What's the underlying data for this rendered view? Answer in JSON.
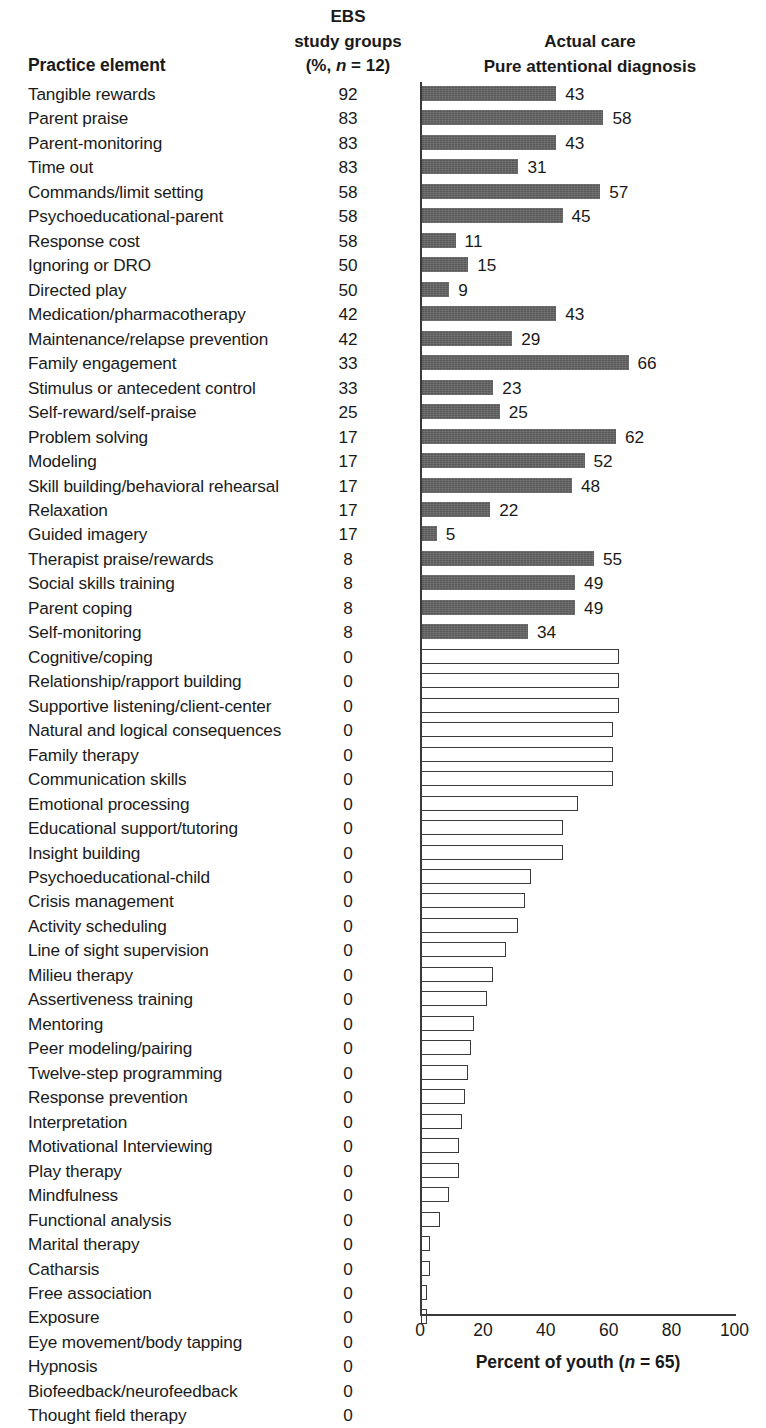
{
  "header": {
    "practice_element": "Practice element",
    "ebs_line1": "EBS",
    "ebs_line2": "study groups",
    "ebs_line3_pre": "(%, ",
    "ebs_line3_ital": "n",
    "ebs_line3_post": " = 12)",
    "actual_line1": "Actual care",
    "actual_line2": "Pure attentional diagnosis"
  },
  "axis": {
    "ticks": [
      "0",
      "20",
      "40",
      "60",
      "80",
      "100"
    ],
    "xlabel_pre": "Percent of youth (",
    "xlabel_ital": "n",
    "xlabel_post": " = 65)"
  },
  "chart_data": {
    "type": "bar",
    "xlabel": "Percent of youth (n = 65)",
    "ylabel": "Practice element",
    "xlim": [
      0,
      100
    ],
    "grid": false,
    "legend": null,
    "orientation": "horizontal",
    "columns": [
      "Practice element",
      "EBS study groups (%, n = 12)",
      "Actual care Pure attentional diagnosis"
    ],
    "series": [
      {
        "name": "EBS study groups (%, n = 12)",
        "kind": "text-column"
      },
      {
        "name": "Actual care — Pure attentional diagnosis",
        "kind": "bar"
      }
    ],
    "categories": [
      "Tangible rewards",
      "Parent praise",
      "Parent-monitoring",
      "Time out",
      "Commands/limit setting",
      "Psychoeducational-parent",
      "Response cost",
      "Ignoring or DRO",
      "Directed play",
      "Medication/pharmacotherapy",
      "Maintenance/relapse prevention",
      "Family engagement",
      "Stimulus or antecedent control",
      "Self-reward/self-praise",
      "Problem solving",
      "Modeling",
      "Skill building/behavioral rehearsal",
      "Relaxation",
      "Guided imagery",
      "Therapist praise/rewards",
      "Social skills training",
      "Parent coping",
      "Self-monitoring",
      "Cognitive/coping",
      "Relationship/rapport building",
      "Supportive listening/client-center",
      "Natural and logical consequences",
      "Family therapy",
      "Communication skills",
      "Emotional processing",
      "Educational support/tutoring",
      "Insight building",
      "Psychoeducational-child",
      "Crisis management",
      "Activity scheduling",
      "Line of sight supervision",
      "Milieu therapy",
      "Assertiveness training",
      "Mentoring",
      "Peer modeling/pairing",
      "Twelve-step programming",
      "Response prevention",
      "Interpretation",
      "Motivational Interviewing",
      "Play therapy",
      "Mindfulness",
      "Functional analysis",
      "Marital therapy",
      "Catharsis",
      "Free association",
      "Exposure",
      "Eye movement/body tapping",
      "Hypnosis",
      "Biofeedback/neurofeedback",
      "Thought field therapy"
    ],
    "ebs_percent": [
      92,
      83,
      83,
      83,
      58,
      58,
      58,
      50,
      50,
      42,
      42,
      33,
      33,
      25,
      17,
      17,
      17,
      17,
      17,
      8,
      8,
      8,
      8,
      0,
      0,
      0,
      0,
      0,
      0,
      0,
      0,
      0,
      0,
      0,
      0,
      0,
      0,
      0,
      0,
      0,
      0,
      0,
      0,
      0,
      0,
      0,
      0,
      0,
      0,
      0,
      0,
      0,
      0,
      0,
      0
    ],
    "actual_care_percent": [
      43,
      58,
      43,
      31,
      57,
      45,
      11,
      15,
      9,
      43,
      29,
      66,
      23,
      25,
      62,
      52,
      48,
      22,
      5,
      55,
      49,
      49,
      34,
      63,
      63,
      63,
      61,
      61,
      61,
      50,
      45,
      45,
      35,
      33,
      31,
      27,
      23,
      21,
      17,
      16,
      15,
      14,
      13,
      12,
      12,
      9,
      6,
      3,
      3,
      2,
      2,
      0,
      0,
      0,
      0
    ],
    "actual_care_labeled": [
      true,
      true,
      true,
      true,
      true,
      true,
      true,
      true,
      true,
      true,
      true,
      true,
      true,
      true,
      true,
      true,
      true,
      true,
      true,
      true,
      true,
      true,
      true,
      false,
      false,
      false,
      false,
      false,
      false,
      false,
      false,
      false,
      false,
      false,
      false,
      false,
      false,
      false,
      false,
      false,
      false,
      false,
      false,
      false,
      false,
      false,
      false,
      false,
      false,
      false,
      false,
      false,
      false,
      false,
      false
    ],
    "bar_style": "rows 1-23 solid dark gray; rows 24-55 hollow white with black outline; rows 52-55 have no visible bar (value 0)",
    "colors": {
      "filled_bar": "#595959",
      "hollow_bar_outline": "#3a3a3a",
      "text": "#1a1a1a",
      "background": "#ffffff"
    }
  }
}
